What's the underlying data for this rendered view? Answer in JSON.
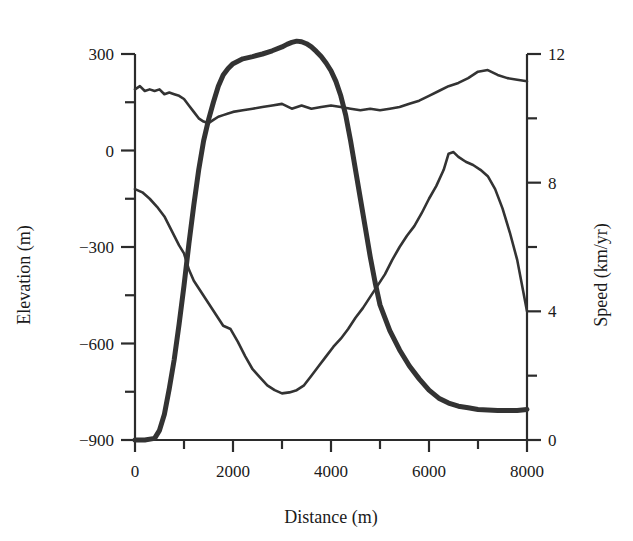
{
  "chart_data": {
    "type": "line",
    "title": "",
    "xlabel": "Distance (m)",
    "ylabel": "Elevation (m)",
    "y2label": "Speed (km/yr)",
    "xlim": [
      0,
      8000
    ],
    "ylim": [
      -900,
      300
    ],
    "y2lim": [
      0,
      12
    ],
    "grid": false,
    "legend": "none",
    "xticks": [
      0,
      2000,
      4000,
      6000,
      8000
    ],
    "xticklabels": [
      "0",
      "2000",
      "4000",
      "6000",
      "8000"
    ],
    "xminorticks": [
      1000,
      3000,
      5000,
      7000
    ],
    "yticks": [
      -900,
      -600,
      -300,
      0,
      300
    ],
    "yticklabels": [
      "-900",
      "-600",
      "-300",
      "0",
      "300"
    ],
    "yminorticks": [
      -750,
      -450,
      -150,
      150
    ],
    "y2ticks": [
      0,
      4,
      8,
      12
    ],
    "y2ticklabels": [
      "0",
      "4",
      "8",
      "12"
    ],
    "y2minorticks": [
      2,
      6,
      10
    ],
    "series": [
      {
        "name": "Ice surface elevation",
        "axis": "left",
        "style": "thick",
        "linewidth": 5,
        "color": "#333333",
        "x": [
          0,
          200,
          400,
          500,
          600,
          700,
          800,
          900,
          1000,
          1100,
          1200,
          1300,
          1400,
          1500,
          1600,
          1700,
          1800,
          1900,
          2000,
          2200,
          2400,
          2600,
          2800,
          3000,
          3100,
          3200,
          3300,
          3400,
          3500,
          3600,
          3700,
          3800,
          3900,
          4000,
          4100,
          4200,
          4300,
          4400,
          4500,
          4600,
          4700,
          4800,
          4900,
          5000,
          5200,
          5400,
          5600,
          5800,
          6000,
          6200,
          6400,
          6600,
          6800,
          7000,
          7400,
          7800,
          8000
        ],
        "y": [
          -900,
          -900,
          -895,
          -870,
          -820,
          -740,
          -650,
          -540,
          -420,
          -290,
          -170,
          -60,
          30,
          95,
          150,
          200,
          235,
          255,
          270,
          285,
          292,
          300,
          310,
          322,
          330,
          336,
          340,
          338,
          332,
          322,
          308,
          292,
          272,
          248,
          215,
          170,
          110,
          30,
          -60,
          -150,
          -240,
          -330,
          -410,
          -480,
          -560,
          -620,
          -670,
          -710,
          -745,
          -770,
          -785,
          -795,
          -800,
          -805,
          -808,
          -808,
          -805
        ]
      },
      {
        "name": "Bed elevation",
        "axis": "left",
        "style": "thin",
        "linewidth": 2.6,
        "color": "#333333",
        "x": [
          0,
          150,
          300,
          450,
          600,
          750,
          900,
          1000,
          1100,
          1200,
          1350,
          1500,
          1650,
          1800,
          1950,
          2100,
          2250,
          2400,
          2550,
          2700,
          2850,
          3000,
          3150,
          3300,
          3450,
          3600,
          3750,
          3900,
          4050,
          4200,
          4350,
          4500,
          4650,
          4800,
          4950,
          5100,
          5250,
          5400,
          5550,
          5700,
          5850,
          6000,
          6150,
          6300,
          6400,
          6500,
          6600,
          6750,
          6900,
          7050,
          7200,
          7350,
          7500,
          7650,
          7800,
          8000
        ],
        "y": [
          -120,
          -130,
          -150,
          -175,
          -205,
          -250,
          -295,
          -320,
          -370,
          -405,
          -440,
          -475,
          -510,
          -545,
          -555,
          -595,
          -640,
          -680,
          -705,
          -730,
          -745,
          -755,
          -752,
          -745,
          -730,
          -700,
          -670,
          -640,
          -610,
          -585,
          -555,
          -520,
          -490,
          -455,
          -420,
          -385,
          -340,
          -300,
          -265,
          -235,
          -195,
          -150,
          -110,
          -60,
          -10,
          -5,
          -20,
          -35,
          -45,
          -60,
          -80,
          -120,
          -180,
          -255,
          -340,
          -500
        ]
      },
      {
        "name": "Surface speed",
        "axis": "right",
        "style": "thin",
        "linewidth": 2.6,
        "color": "#333333",
        "x": [
          0,
          100,
          200,
          300,
          400,
          500,
          600,
          700,
          800,
          900,
          1000,
          1100,
          1200,
          1300,
          1400,
          1500,
          1600,
          1700,
          1800,
          1900,
          2000,
          2200,
          2400,
          2600,
          2800,
          3000,
          3200,
          3400,
          3600,
          3800,
          4000,
          4200,
          4400,
          4600,
          4800,
          5000,
          5200,
          5400,
          5600,
          5800,
          6000,
          6200,
          6400,
          6600,
          6800,
          7000,
          7200,
          7400,
          7600,
          7800,
          8000
        ],
        "y": [
          10.9,
          11.0,
          10.85,
          10.9,
          10.85,
          10.9,
          10.75,
          10.8,
          10.75,
          10.7,
          10.6,
          10.4,
          10.2,
          10.0,
          9.9,
          9.85,
          9.95,
          10.05,
          10.1,
          10.15,
          10.2,
          10.25,
          10.3,
          10.35,
          10.4,
          10.45,
          10.3,
          10.4,
          10.3,
          10.35,
          10.4,
          10.35,
          10.3,
          10.25,
          10.3,
          10.25,
          10.3,
          10.35,
          10.45,
          10.55,
          10.7,
          10.85,
          11.0,
          11.1,
          11.25,
          11.45,
          11.5,
          11.35,
          11.25,
          11.2,
          11.15
        ]
      }
    ]
  },
  "axes": {
    "x_title": "Distance (m)",
    "y_left_title": "Elevation (m)",
    "y_right_title": "Speed (km/yr)"
  }
}
